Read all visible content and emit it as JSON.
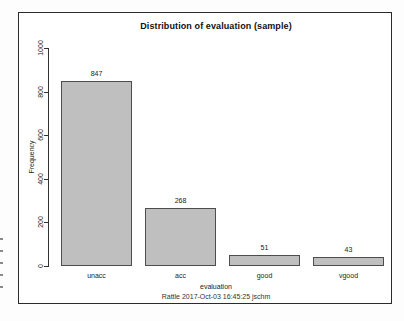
{
  "figure": {
    "title": "Distribution of evaluation (sample)",
    "xlabel": "evaluation",
    "ylabel": "Frequency",
    "caption": "Rattle 2017-Oct-03 16:45:25 jschm"
  },
  "chart_data": {
    "type": "bar",
    "title": "Distribution of evaluation (sample)",
    "categories": [
      "unacc",
      "acc",
      "good",
      "vgood"
    ],
    "values": [
      847,
      268,
      51,
      43
    ],
    "bar_labels": [
      "847",
      "268",
      "51",
      "43"
    ],
    "xlabel": "evaluation",
    "ylabel": "Frequency",
    "caption": "Rattle 2017-Oct-03 16:45:25 jschm",
    "ylim": [
      0,
      1000
    ],
    "yticks": [
      0,
      200,
      400,
      600,
      800,
      1000
    ],
    "grid": false,
    "legend_position": "none",
    "bar_fill_color": "#bfbfbf",
    "bar_border_color": "#4d4d4d",
    "frame_color": "#2b2b2b",
    "background_color": "#ffffff"
  }
}
